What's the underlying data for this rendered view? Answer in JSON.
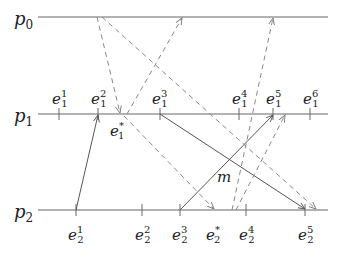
{
  "diagram": {
    "type": "space-time process diagram",
    "processes": [
      {
        "id": "p0",
        "label": "p",
        "sub": "0",
        "y": 17
      },
      {
        "id": "p1",
        "label": "p",
        "sub": "1",
        "y": 114
      },
      {
        "id": "p2",
        "label": "p",
        "sub": "2",
        "y": 210
      }
    ],
    "events_p1": [
      {
        "base": "e",
        "sup": "1",
        "sub": "1",
        "x": 59
      },
      {
        "base": "e",
        "sup": "2",
        "sub": "1",
        "x": 98
      },
      {
        "base": "e",
        "sup": "3",
        "sub": "1",
        "x": 160
      },
      {
        "base": "e",
        "sup": "4",
        "sub": "1",
        "x": 239
      },
      {
        "base": "e",
        "sup": "5",
        "sub": "1",
        "x": 273
      },
      {
        "base": "e",
        "sup": "6",
        "sub": "1",
        "x": 310
      }
    ],
    "special_p1": {
      "base": "e",
      "sup": "*",
      "sub": "1"
    },
    "events_p2": [
      {
        "base": "e",
        "sup": "1",
        "sub": "2",
        "x": 76
      },
      {
        "base": "e",
        "sup": "2",
        "sub": "2",
        "x": 142
      },
      {
        "base": "e",
        "sup": "3",
        "sub": "2",
        "x": 180
      },
      {
        "base": "e",
        "sup": "*",
        "sub": "2",
        "x": 214
      },
      {
        "base": "e",
        "sup": "4",
        "sub": "2",
        "x": 246
      },
      {
        "base": "e",
        "sup": "5",
        "sub": "2",
        "x": 305
      }
    ],
    "message_label": "m",
    "colors": {
      "line": "#555555",
      "dash": "#777777",
      "text": "#222222"
    }
  }
}
